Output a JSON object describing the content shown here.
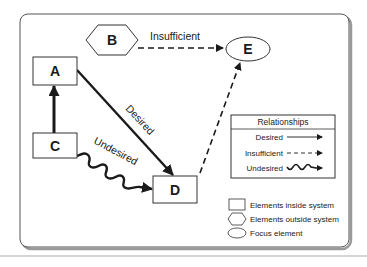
{
  "diagram": {
    "nodes": {
      "A": {
        "label": "A",
        "type": "element-inside-system"
      },
      "B": {
        "label": "B",
        "type": "element-outside-system"
      },
      "C": {
        "label": "C",
        "type": "element-inside-system"
      },
      "D": {
        "label": "D",
        "type": "element-inside-system"
      },
      "E": {
        "label": "E",
        "type": "focus-element"
      }
    },
    "edges": [
      {
        "from": "B",
        "to": "E",
        "relationship": "Insufficient",
        "label": "Insufficient"
      },
      {
        "from": "C",
        "to": "A",
        "relationship": "Desired",
        "label": ""
      },
      {
        "from": "A",
        "to": "D",
        "relationship": "Desired",
        "label": "Desired"
      },
      {
        "from": "C",
        "to": "D",
        "relationship": "Undesired",
        "label": "Undesired"
      },
      {
        "from": "D",
        "to": "E",
        "relationship": "Insufficient",
        "label": ""
      }
    ],
    "edge_labels": {
      "b_to_e": "Insufficient",
      "a_to_d": "Desired",
      "c_to_d": "Undesired"
    }
  },
  "legend": {
    "relationships": {
      "title": "Relationships",
      "items": [
        {
          "label": "Desired",
          "style": "solid"
        },
        {
          "label": "Insufficient",
          "style": "dashed"
        },
        {
          "label": "Undesired",
          "style": "wavy"
        }
      ]
    },
    "shapes": [
      {
        "label": "Elements inside system",
        "shape": "rectangle"
      },
      {
        "label": "Elements outside system",
        "shape": "hexagon"
      },
      {
        "label": "Focus element",
        "shape": "ellipse"
      }
    ]
  },
  "colors": {
    "stroke": "#1a1a1a",
    "frame": "#555555",
    "shadow": "#9a9a9a",
    "background": "#ffffff"
  }
}
